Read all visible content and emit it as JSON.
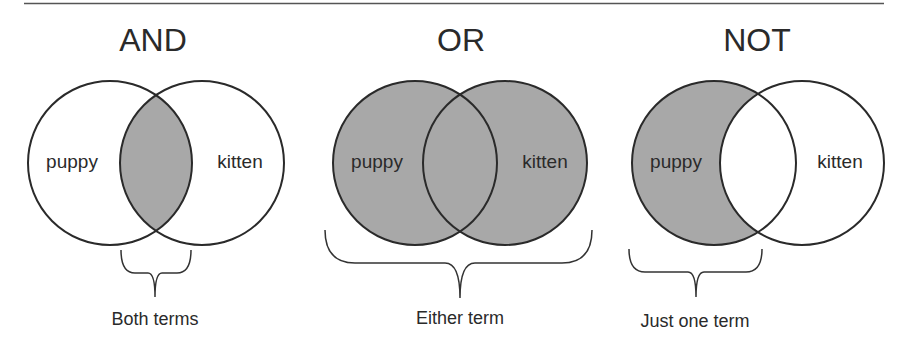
{
  "colors": {
    "fill": "#a8a8a8",
    "stroke": "#2a2a2a",
    "rule": "#555555"
  },
  "panels": [
    {
      "title": "AND",
      "left_label": "puppy",
      "right_label": "kitten",
      "shaded": "intersection",
      "caption": "Both terms"
    },
    {
      "title": "OR",
      "left_label": "puppy",
      "right_label": "kitten",
      "shaded": "union",
      "caption": "Either term"
    },
    {
      "title": "NOT",
      "left_label": "puppy",
      "right_label": "kitten",
      "shaded": "left-only",
      "caption": "Just one term"
    }
  ]
}
